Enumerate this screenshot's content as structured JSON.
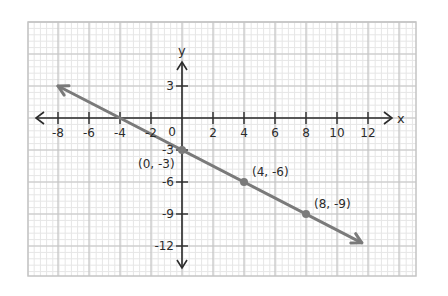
{
  "chart_data": {
    "type": "line",
    "title": "",
    "xlabel": "x",
    "ylabel": "y",
    "xlim": [
      -9.7,
      15.4
    ],
    "ylim": [
      -15.0,
      9.1
    ],
    "grid": true,
    "x_ticks": [
      -8,
      -6,
      -4,
      -2,
      2,
      4,
      6,
      8,
      10,
      12
    ],
    "x_tick_labels": [
      "-8",
      "-6",
      "-4",
      "-2",
      "2",
      "4",
      "6",
      "8",
      "10",
      "12"
    ],
    "origin_label": "0",
    "y_ticks": [
      3,
      -3,
      -6,
      -9,
      -12
    ],
    "y_tick_labels": [
      "3",
      "-3",
      "-6",
      "-9",
      "-12"
    ],
    "series": [
      {
        "name": "y = -3/4 x - 3",
        "equation": "y = -0.75x - 3",
        "x": [
          -8,
          11.6
        ],
        "y": [
          3,
          -11.7
        ],
        "color": "#7a7a7a",
        "arrows": "both"
      }
    ],
    "points": [
      {
        "x": 0,
        "y": -3,
        "label": "(0, -3)"
      },
      {
        "x": 4,
        "y": -6,
        "label": "(4, -6)"
      },
      {
        "x": 8,
        "y": -9,
        "label": "(8, -9)"
      }
    ],
    "colors": {
      "axis": "#2b2b2b",
      "line": "#7a7a7a",
      "grid_major": "#c4c4c4",
      "grid_minor": "#e6e6e6"
    }
  }
}
